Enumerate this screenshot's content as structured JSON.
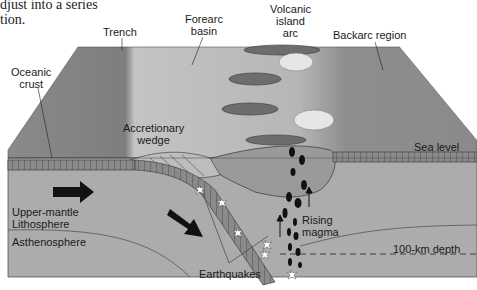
{
  "caption": {
    "line1": "djust into a series",
    "line2": "tion."
  },
  "labels": {
    "trench": "Trench",
    "forearc_basin_1": "Forearc",
    "forearc_basin_2": "basin",
    "volcanic_arc_1": "Volcanic",
    "volcanic_arc_2": "island",
    "volcanic_arc_3": "arc",
    "backarc_region": "Backarc region",
    "oceanic_crust_1": "Oceanic",
    "oceanic_crust_2": "crust",
    "accretionary_wedge_1": "Accretionary",
    "accretionary_wedge_2": "wedge",
    "sea_level": "Sea level",
    "upper_mantle_1": "Upper-mantle",
    "upper_mantle_2": "Lithosphere",
    "asthenosphere": "Asthenosphere",
    "rising_magma_1": "Rising",
    "rising_magma_2": "magma",
    "depth": "100-km depth",
    "earthquakes": "Earthquakes"
  },
  "colors": {
    "sea_surface_light": "#b9b9b9",
    "sea_surface_dark": "#8f8f8f",
    "backarc_dark": "#8c8c8c",
    "mantle": "#a9a9a9",
    "asthenosphere": "#b3b3b3",
    "crust": "#7d7d7d",
    "arrow": "#111111"
  }
}
